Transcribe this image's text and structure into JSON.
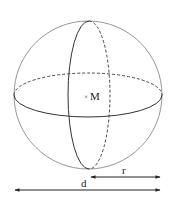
{
  "diagram": {
    "type": "sphere-with-great-circles",
    "center_label": "M",
    "center_marker": "×",
    "radius_label": "r",
    "diameter_label": "d",
    "colors": {
      "outline": "#8a8a8a",
      "stroke": "#333333",
      "text": "#222222"
    }
  }
}
